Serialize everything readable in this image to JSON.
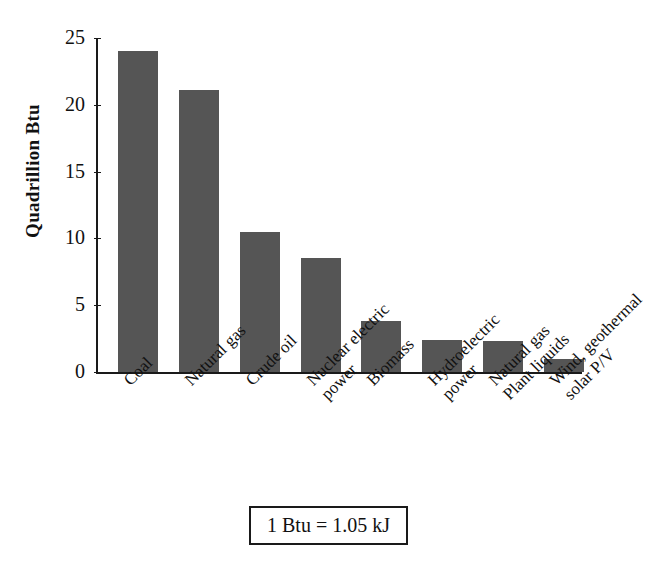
{
  "chart_data": {
    "type": "bar",
    "title": "",
    "xlabel": "",
    "ylabel": "Quadrillion Btu",
    "ylim": [
      0,
      25
    ],
    "yticks": [
      0,
      5,
      10,
      15,
      20,
      25
    ],
    "grid": false,
    "legend": "none",
    "bar_color": "#555555",
    "axis_color": "#1a1a1a",
    "categories": [
      "Coal",
      "Natural gas",
      "Crude oil",
      "Nuclear electric power",
      "Biomass",
      "Hydroelectric power",
      "Natural gas Plant liquids",
      "Wind, geothermal solar P/V"
    ],
    "category_lines": [
      [
        "Coal",
        ""
      ],
      [
        "Natural gas",
        ""
      ],
      [
        "Crude oil",
        ""
      ],
      [
        "Nuclear electric",
        "power"
      ],
      [
        "Biomass",
        ""
      ],
      [
        "Hydroelectric",
        "power"
      ],
      [
        "Natural gas",
        "Plant liquids"
      ],
      [
        "Wind, geothermal",
        "solar P/V"
      ]
    ],
    "values": [
      24.0,
      21.1,
      10.5,
      8.5,
      3.8,
      2.4,
      2.3,
      1.0
    ],
    "annotation": "1 Btu = 1.05 kJ"
  }
}
